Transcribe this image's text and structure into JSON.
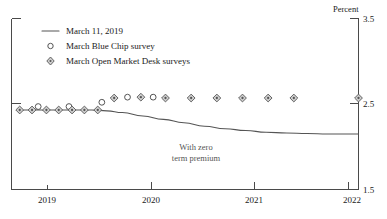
{
  "chart_data": {
    "type": "line",
    "title": "",
    "subtitle": "",
    "xlabel": "",
    "ylabel": "Percent",
    "ylim": [
      1.5,
      3.5
    ],
    "xlim": [
      2018.62,
      2022.0
    ],
    "grid": false,
    "legend_position": "top-left",
    "y_ticks": [
      "3.5",
      "2.5",
      "1.5"
    ],
    "y_tick_values": [
      3.5,
      2.5,
      1.5
    ],
    "x_ticks": [
      "2019",
      "2020",
      "2021",
      "2022"
    ],
    "x_tick_values": [
      2019,
      2020,
      2021,
      2022
    ],
    "annotations": [
      {
        "name": "with-zero-term-premium",
        "line1": "With zero",
        "line2": "term premium",
        "x": 2019.85,
        "y": 2.06
      }
    ],
    "series": [
      {
        "name": "March 11, 2019",
        "marker": "line",
        "style": "solid-line",
        "color": "#555555",
        "x": [
          2018.7,
          2018.85,
          2019.0,
          2019.2,
          2019.4,
          2019.55,
          2019.7,
          2019.9,
          2020.1,
          2020.3,
          2020.5,
          2020.7,
          2020.9,
          2021.1,
          2021.3,
          2021.5,
          2021.7,
          2021.85,
          2022.0
        ],
        "values": [
          2.43,
          2.43,
          2.43,
          2.43,
          2.43,
          2.42,
          2.4,
          2.36,
          2.32,
          2.28,
          2.24,
          2.21,
          2.19,
          2.17,
          2.16,
          2.155,
          2.15,
          2.15,
          2.15
        ]
      },
      {
        "name": "March Blue Chip survey",
        "marker": "open-circle",
        "style": "markers",
        "color": "#555555",
        "x": [
          2018.88,
          2019.18,
          2019.5,
          2019.75,
          2020.0
        ],
        "values": [
          2.47,
          2.47,
          2.52,
          2.58,
          2.58
        ]
      },
      {
        "name": "March Open Market Desk surveys",
        "marker": "diamond",
        "style": "markers",
        "color": "#555555",
        "x": [
          2018.7,
          2018.82,
          2018.96,
          2019.08,
          2019.21,
          2019.33,
          2019.46,
          2019.62,
          2019.88,
          2020.12,
          2020.37,
          2020.62,
          2020.87,
          2021.12,
          2021.37,
          2022.0
        ],
        "values": [
          2.43,
          2.43,
          2.43,
          2.43,
          2.43,
          2.43,
          2.43,
          2.57,
          2.58,
          2.57,
          2.57,
          2.57,
          2.57,
          2.57,
          2.57,
          2.57
        ]
      }
    ],
    "legend": [
      {
        "label": "March 11, 2019",
        "marker": "line"
      },
      {
        "label": "March Blue Chip survey",
        "marker": "open-circle"
      },
      {
        "label": "March Open Market Desk surveys",
        "marker": "diamond"
      }
    ]
  },
  "axis": {
    "unit_label": "Percent",
    "y_top": "3.5",
    "y_mid": "2.5",
    "y_bottom": "1.5",
    "x_2019": "2019",
    "x_2020": "2020",
    "x_2021": "2021",
    "x_2022": "2022"
  },
  "legend": {
    "item0": "March 11, 2019",
    "item1": "March Blue Chip survey",
    "item2": "March Open Market Desk surveys"
  },
  "annotation": {
    "line1": "With zero",
    "line2": "term premium"
  }
}
